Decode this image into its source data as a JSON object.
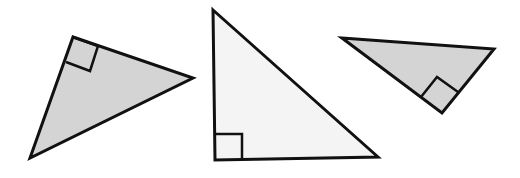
{
  "diagram": {
    "colors": {
      "stroke": "#111111",
      "fill_gray": "#d4d4d4",
      "fill_light": "#f4f4f4",
      "background": "#ffffff"
    },
    "triangles": [
      {
        "name": "triangle-left",
        "points": "73,37 193,78 30,158",
        "marker": "73,37 98,46 90,71 66,62",
        "fill": "#d4d4d4"
      },
      {
        "name": "triangle-middle",
        "points": "213,10 378,157 215,160",
        "marker": "215,134 242,134 242,160",
        "fill": "#f4f4f4"
      },
      {
        "name": "triangle-right",
        "points": "342,38 494,49 442,113",
        "marker": "421,97 437,77 458,92",
        "fill": "#d4d4d4"
      }
    ]
  }
}
